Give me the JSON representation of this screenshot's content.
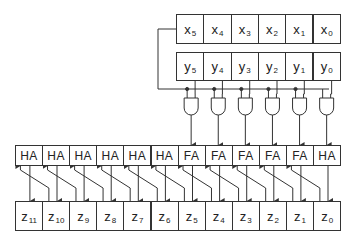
{
  "registers": {
    "x": [
      {
        "base": "x",
        "sub": "5"
      },
      {
        "base": "x",
        "sub": "4"
      },
      {
        "base": "x",
        "sub": "3"
      },
      {
        "base": "x",
        "sub": "2"
      },
      {
        "base": "x",
        "sub": "1"
      },
      {
        "base": "x",
        "sub": "0"
      }
    ],
    "y": [
      {
        "base": "y",
        "sub": "5"
      },
      {
        "base": "y",
        "sub": "4"
      },
      {
        "base": "y",
        "sub": "3"
      },
      {
        "base": "y",
        "sub": "2"
      },
      {
        "base": "y",
        "sub": "1"
      },
      {
        "base": "y",
        "sub": "0"
      }
    ]
  },
  "gates": {
    "count": 6,
    "type": "AND"
  },
  "adders": [
    "HA",
    "HA",
    "HA",
    "HA",
    "HA",
    "HA",
    "FA",
    "FA",
    "FA",
    "FA",
    "FA",
    "HA"
  ],
  "outputs": [
    {
      "base": "z",
      "sub": "11"
    },
    {
      "base": "z",
      "sub": "10"
    },
    {
      "base": "z",
      "sub": "9"
    },
    {
      "base": "z",
      "sub": "8"
    },
    {
      "base": "z",
      "sub": "7"
    },
    {
      "base": "z",
      "sub": "6"
    },
    {
      "base": "z",
      "sub": "5"
    },
    {
      "base": "z",
      "sub": "4"
    },
    {
      "base": "z",
      "sub": "3"
    },
    {
      "base": "z",
      "sub": "2"
    },
    {
      "base": "z",
      "sub": "1"
    },
    {
      "base": "z",
      "sub": "0"
    }
  ],
  "colors": {
    "line": "#333333",
    "background": "#ffffff"
  }
}
